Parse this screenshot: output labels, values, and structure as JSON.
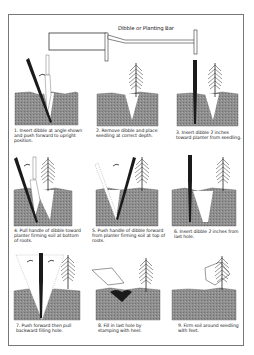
{
  "title": "Dibble or Planting Bar",
  "steps": [
    {
      "num": "1.",
      "text": "Insert dibble at angle shown and push forward to upright position."
    },
    {
      "num": "2.",
      "text": "Remove dibble and place seedling at correct depth."
    },
    {
      "num": "3.",
      "text": "Insert dibble 2 inches toward planter from seedling."
    },
    {
      "num": "4.",
      "text": "Pull handle of dibble toward planter firming soil at bottom of roots."
    },
    {
      "num": "5.",
      "text": "Push handle of dibble forward from planter firming soil at top of roots."
    },
    {
      "num": "6.",
      "text": "Insert dibble 2 inches from last hole."
    },
    {
      "num": "7.",
      "text": "Push forward then pull backward filling hole."
    },
    {
      "num": "8.",
      "text": "Fill in last hole by stamping with heel."
    },
    {
      "num": "9.",
      "text": "Firm soil around seedling with feet."
    }
  ],
  "colors": {
    "soil": "#8a8a8a",
    "dibble": "#1a1a1a",
    "frame": "#777777"
  }
}
